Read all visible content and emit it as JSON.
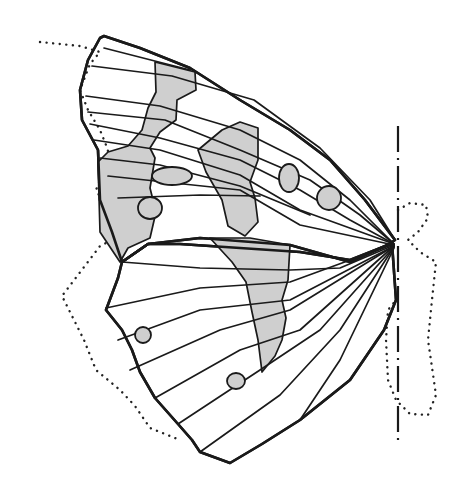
{
  "figure": {
    "title": "",
    "colors": {
      "background": "#ffffff",
      "ink": "#1a1a1a",
      "shade": "#cfcfcf"
    }
  },
  "shapes": {
    "forewing_outline": "M100,38 L104,36 L140,48 L190,68 L240,100 L290,130 L330,160 L365,200 L395,240 L388,245 L350,260 L300,252 L240,248 L180,244 L148,244 L122,262 L112,232 L100,200 L98,150 L82,120 L80,90 L88,60 Z",
    "hindwing_outline": "M122,262 L148,244 L200,238 L290,245 L350,262 L392,243 L396,300 L392,310 L384,330 L350,380 L300,420 L262,444 L230,463 L200,452 L192,440 L178,424 L155,398 L140,372 L132,350 L122,330 L106,310 L118,278 Z",
    "bands": [
      "M155,62 L195,72 L196,90 L177,100 L176,120 L160,132 L150,148 L155,158 L150,188 L156,212 L150,238 L128,248 L120,262 L100,232 L98,162 L108,152 L128,146 L142,130 L148,108 L156,92 Z",
      "M222,130 L240,122 L258,128 L258,160 L250,182 L255,198 L258,222 L245,236 L228,226 L222,200 L206,172 L198,150 Z",
      "M210,238 L250,238 L290,245 L288,280 L282,300 L286,318 L282,340 L275,356 L262,372 L258,340 L252,312 L246,282 L232,262 Z"
    ],
    "veins": [
      "M104,48 L190,70",
      "M92,66 L172,76 L254,100 L320,148 L370,200 L395,240",
      "M86,96 L160,106 L240,130 L300,160 L350,200 L392,242",
      "M88,112 L165,120 L240,150 L310,180 L360,215 L393,243",
      "M90,124 L160,138 L240,160 L300,190 L350,220 L394,244",
      "M94,140 L160,150 L240,175 L300,210 L394,244",
      "M100,158 L160,165 L240,186 L310,215",
      "M108,176 L240,190 L300,225 L394,245",
      "M118,198 L200,195 L260,196",
      "M122,262 L200,268 L290,270 L340,268 L394,245",
      "M106,308 L200,288 L290,282 L394,244",
      "M118,340 L200,310 L290,300 L394,246",
      "M130,370 L220,330 L290,310 L394,246",
      "M155,398 L240,350 L300,330 L394,246",
      "M178,424 L260,370 L320,330 L394,247",
      "M200,452 L280,395 L340,330 L394,247",
      "M300,420 L340,360 L394,248"
    ],
    "spots": [
      {
        "cx": 172,
        "cy": 176,
        "rx": 20,
        "ry": 9
      },
      {
        "cx": 150,
        "cy": 208,
        "rx": 12,
        "ry": 11
      },
      {
        "cx": 289,
        "cy": 178,
        "rx": 10,
        "ry": 14
      },
      {
        "cx": 329,
        "cy": 198,
        "rx": 12,
        "ry": 12
      },
      {
        "cx": 143,
        "cy": 335,
        "rx": 8,
        "ry": 8
      },
      {
        "cx": 236,
        "cy": 381,
        "rx": 9,
        "ry": 8
      }
    ],
    "dotted_wing_outline": "M40,42 L80,46 L100,52 L90,64 L80,90 L88,110 L100,130 L108,150 L104,170 L96,190 L108,210 L116,238 L100,246 L62,296 L84,340 L96,370 L120,390 L135,406 L150,428 L180,440",
    "dotted_body_outline": "M398,210 L410,203 L426,205 L428,218 L418,232 L408,240 L420,252 L436,262 L432,300 L428,340 L436,395 L428,415 L410,414 L396,400 L388,380 L386,340 L388,310 L396,300",
    "body_axis": "M398,126 L398,446"
  }
}
